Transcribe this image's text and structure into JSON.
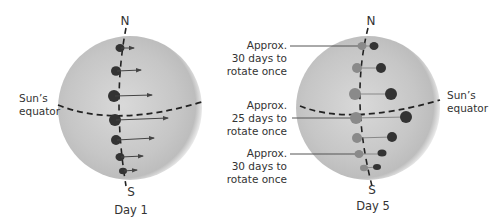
{
  "panels": [
    {
      "id": "day1",
      "caption": "Day 1",
      "north_label": "N",
      "south_label": "S",
      "equator_label_line1": "Sun’s",
      "equator_label_line2": "equator"
    },
    {
      "id": "day5",
      "caption": "Day 5",
      "north_label": "N",
      "south_label": "S",
      "equator_label_line1": "Sun’s",
      "equator_label_line2": "equator"
    }
  ],
  "annotations": [
    {
      "line1": "Approx.",
      "line2": "30 days to",
      "line3": "rotate once"
    },
    {
      "line1": "Approx.",
      "line2": "25 days to",
      "line3": "rotate once"
    },
    {
      "line1": "Approx.",
      "line2": "30 days to",
      "line3": "rotate once"
    }
  ],
  "colors": {
    "sun_center": "#d6d6d6",
    "sun_edge": "#a9a9a9",
    "spot_dark": "#333333",
    "spot_faded": "#8a8a8a",
    "line": "#444444",
    "text": "#333333"
  }
}
